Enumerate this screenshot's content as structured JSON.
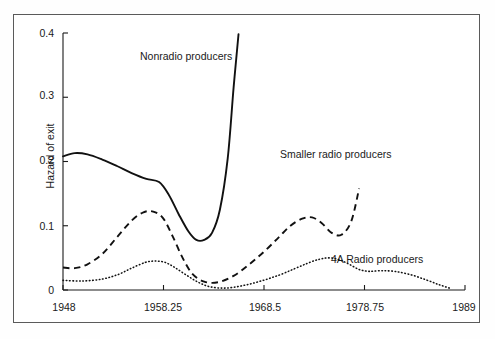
{
  "chart_data": {
    "type": "line",
    "title": "",
    "xlabel": "",
    "ylabel": "Hazard of exit",
    "xlim": [
      1948,
      1989
    ],
    "ylim": [
      0,
      0.4
    ],
    "grid": false,
    "legend_position": "inline-annotations",
    "x_tick_labels": [
      "1948",
      "1958.25",
      "1968.5",
      "1978.75",
      "1989"
    ],
    "x_tick_values": [
      1948,
      1958.25,
      1968.5,
      1978.75,
      1989
    ],
    "y_tick_labels": [
      "0",
      "0.1",
      "0.2",
      "0.3",
      "0.4"
    ],
    "y_tick_values": [
      0,
      0.1,
      0.2,
      0.3,
      0.4
    ],
    "series": [
      {
        "name": "Nonradio producers",
        "style": "solid",
        "color": "#111111",
        "x": [
          1948,
          1949.2,
          1950.5,
          1952,
          1953.5,
          1955,
          1956.5,
          1957.8,
          1958.8,
          1959.8,
          1960.8,
          1961.6,
          1962.4,
          1963.2,
          1964,
          1964.8,
          1965.4,
          1965.9
        ],
        "values": [
          0.208,
          0.213,
          0.211,
          0.203,
          0.193,
          0.182,
          0.173,
          0.168,
          0.148,
          0.118,
          0.091,
          0.078,
          0.078,
          0.089,
          0.125,
          0.205,
          0.315,
          0.398
        ]
      },
      {
        "name": "Smaller radio producers",
        "style": "dashed",
        "color": "#111111",
        "x": [
          1948,
          1949.2,
          1950.5,
          1952,
          1953.5,
          1955,
          1956.2,
          1957.2,
          1958.2,
          1959.2,
          1960.2,
          1961.2,
          1962.4,
          1963.8,
          1965.4,
          1967,
          1968.6,
          1970,
          1971.2,
          1972.4,
          1973.4,
          1974.4,
          1975.4,
          1976.4,
          1977.4,
          1978.2
        ],
        "values": [
          0.035,
          0.034,
          0.04,
          0.056,
          0.082,
          0.108,
          0.121,
          0.122,
          0.112,
          0.083,
          0.05,
          0.025,
          0.013,
          0.012,
          0.022,
          0.04,
          0.061,
          0.082,
          0.1,
          0.111,
          0.113,
          0.104,
          0.089,
          0.086,
          0.107,
          0.158
        ]
      },
      {
        "name": "4A Radio producers",
        "style": "dotted",
        "color": "#111111",
        "x": [
          1948,
          1950,
          1952,
          1953.6,
          1955,
          1956.4,
          1957.4,
          1958.4,
          1959.4,
          1960.6,
          1961.8,
          1963,
          1964.6,
          1966.4,
          1968.2,
          1970,
          1971.6,
          1973,
          1974.2,
          1975.2,
          1976.2,
          1977.2,
          1978.2,
          1979.2,
          1980.4,
          1981.8,
          1983.4,
          1985,
          1986.4,
          1987.6
        ],
        "values": [
          0.015,
          0.014,
          0.017,
          0.024,
          0.034,
          0.043,
          0.045,
          0.043,
          0.035,
          0.023,
          0.012,
          0.005,
          0.003,
          0.007,
          0.014,
          0.023,
          0.033,
          0.042,
          0.048,
          0.05,
          0.047,
          0.04,
          0.032,
          0.029,
          0.03,
          0.029,
          0.024,
          0.016,
          0.008,
          0.002
        ]
      }
    ],
    "annotations": [
      {
        "text": "Nonradio producers",
        "x": 1959.2,
        "y": 0.355
      },
      {
        "text": "Smaller radio producers",
        "x": 1974.4,
        "y": 0.233
      },
      {
        "text": "4A Radio producers",
        "x": 1979.4,
        "y": 0.072
      }
    ]
  },
  "axis": {
    "y_title": "Hazard of exit"
  }
}
